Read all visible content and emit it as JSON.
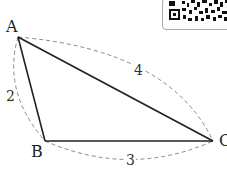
{
  "diagram": {
    "type": "triangle",
    "vertices": [
      {
        "label": "A",
        "x": 18,
        "y": 37
      },
      {
        "label": "B",
        "x": 45,
        "y": 141
      },
      {
        "label": "C",
        "x": 213,
        "y": 141
      }
    ],
    "sides": [
      {
        "from": "A",
        "to": "B",
        "length_label": "2"
      },
      {
        "from": "B",
        "to": "C",
        "length_label": "3"
      },
      {
        "from": "A",
        "to": "C",
        "length_label": "4"
      }
    ],
    "line_color": "#222222",
    "dashed_color": "#888888"
  },
  "qr_code": {
    "visible": true
  }
}
